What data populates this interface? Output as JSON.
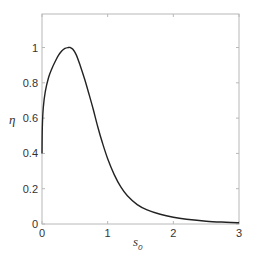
{
  "chart_data": {
    "type": "line",
    "title": "",
    "xlabel": "s0",
    "xlabel_main": "s",
    "xlabel_sub": "0",
    "ylabel": "η",
    "xlim": [
      0,
      3
    ],
    "ylim": [
      0,
      1.19
    ],
    "grid": false,
    "legend": null,
    "x_ticks": [
      0,
      1,
      2,
      3
    ],
    "x_tick_labels": [
      "0",
      "1",
      "2",
      "3"
    ],
    "y_ticks": [
      0,
      0.2,
      0.4,
      0.6,
      0.8,
      1
    ],
    "y_tick_labels": [
      "0",
      "0.2",
      "0.4",
      "0.6",
      "0.8",
      "1"
    ],
    "series": [
      {
        "name": "eta",
        "color": "#222222",
        "x": [
          0.0,
          0.005,
          0.02,
          0.05,
          0.1,
          0.15,
          0.2,
          0.25,
          0.3,
          0.35,
          0.4,
          0.43,
          0.47,
          0.52,
          0.58,
          0.65,
          0.72,
          0.78,
          0.85,
          0.92,
          1.0,
          1.1,
          1.2,
          1.3,
          1.45,
          1.6,
          1.8,
          2.0,
          2.2,
          2.5,
          2.8,
          3.0
        ],
        "y": [
          0.4,
          0.55,
          0.66,
          0.75,
          0.83,
          0.88,
          0.92,
          0.955,
          0.98,
          0.995,
          1.0,
          1.0,
          0.99,
          0.96,
          0.9,
          0.82,
          0.73,
          0.65,
          0.55,
          0.46,
          0.37,
          0.28,
          0.21,
          0.16,
          0.11,
          0.08,
          0.055,
          0.038,
          0.027,
          0.016,
          0.01,
          0.007
        ]
      }
    ]
  }
}
